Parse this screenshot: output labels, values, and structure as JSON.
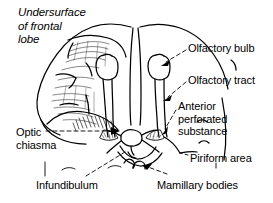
{
  "figure": {
    "kind": "anatomical-line-drawing",
    "background_color": "#ffffff",
    "ink_color": "#000000"
  },
  "title": {
    "line1": "Undersurface",
    "line2": "of frontal",
    "line3": "lobe"
  },
  "labels": {
    "olfactory_bulb": "Olfactory bulb",
    "olfactory_tract": "Olfactory tract",
    "anterior_perforated_substance": {
      "line1": "Anterior",
      "line2": "perforated",
      "line3": "substance"
    },
    "optic_chiasma": {
      "line1": "Optic",
      "line2": "chiasma"
    },
    "piriform_area": "Piriform area",
    "infundibulum": "Infundibulum",
    "mamillary_bodies": "Mamillary bodies"
  }
}
